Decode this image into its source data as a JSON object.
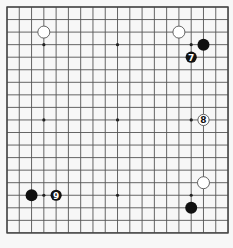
{
  "board": {
    "size": 19,
    "origin_x": 7,
    "origin_y": 7,
    "step_x": 12.28,
    "step_y": 12.55,
    "background": "#f7f7f7",
    "line_color": "#555555",
    "star_points": [
      [
        3,
        3
      ],
      [
        9,
        3
      ],
      [
        15,
        3
      ],
      [
        3,
        9
      ],
      [
        9,
        9
      ],
      [
        15,
        9
      ],
      [
        3,
        15
      ],
      [
        9,
        15
      ],
      [
        15,
        15
      ]
    ],
    "stones": [
      {
        "color": "white",
        "col": 3,
        "row": 2,
        "label": ""
      },
      {
        "color": "white",
        "col": 14,
        "row": 2,
        "label": ""
      },
      {
        "color": "black",
        "col": 16,
        "row": 3,
        "label": ""
      },
      {
        "color": "black",
        "col": 15,
        "row": 4,
        "label": "7"
      },
      {
        "color": "white",
        "col": 16,
        "row": 9,
        "label": "8"
      },
      {
        "color": "white",
        "col": 16,
        "row": 14,
        "label": ""
      },
      {
        "color": "black",
        "col": 15,
        "row": 16,
        "label": ""
      },
      {
        "color": "black",
        "col": 2,
        "row": 15,
        "label": ""
      },
      {
        "color": "black",
        "col": 4,
        "row": 15,
        "label": "9"
      }
    ]
  }
}
